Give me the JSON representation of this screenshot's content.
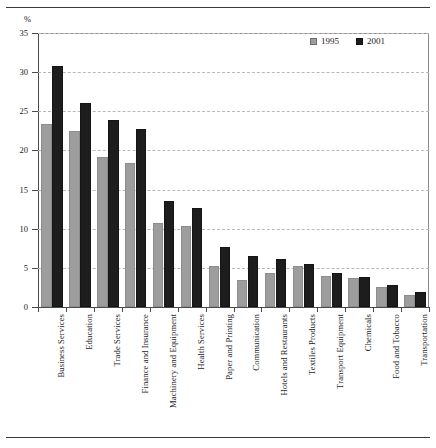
{
  "unit_label": "%",
  "legend": {
    "position": "top-right",
    "entries": [
      {
        "label": "1995",
        "color": "#9d9d9d",
        "swatch": "square-swatch-1995"
      },
      {
        "label": "2001",
        "color": "#1d1d1d",
        "swatch": "square-swatch-2001"
      }
    ]
  },
  "axis": {
    "y_ticks": [
      "0",
      "5",
      "10",
      "15",
      "20",
      "25",
      "30",
      "35"
    ]
  },
  "chart_data": {
    "type": "bar",
    "title": "",
    "subtitle": "",
    "xlabel": "",
    "ylabel": "%",
    "ylim": [
      0,
      35
    ],
    "ytick_values": [
      0,
      5,
      10,
      15,
      20,
      25,
      30,
      35
    ],
    "grid": true,
    "grid_style": "horizontal-dashed",
    "legend_position": "top-right",
    "orientation": "vertical",
    "grouping": "grouped",
    "categories": [
      "Business Services",
      "Education",
      "Trade Services",
      "Finance and Insurance",
      "Machinery and Equipment",
      "Health Services",
      "Paper and Printing",
      "Communication",
      "Hotels and Restaurants",
      "Textiles Products",
      "Transport Equipment",
      "Chemicals",
      "Food and Tobacco",
      "Transportation"
    ],
    "series": [
      {
        "name": "1995",
        "color": "#9d9d9d",
        "values": [
          23.4,
          22.5,
          19.2,
          18.4,
          10.7,
          10.4,
          5.3,
          3.4,
          4.3,
          5.2,
          4.0,
          3.7,
          2.6,
          1.5
        ]
      },
      {
        "name": "2001",
        "color": "#1d1d1d",
        "values": [
          30.8,
          26.0,
          23.9,
          22.8,
          13.6,
          12.6,
          7.7,
          6.5,
          6.1,
          5.5,
          4.3,
          3.8,
          2.8,
          1.9
        ]
      }
    ]
  }
}
